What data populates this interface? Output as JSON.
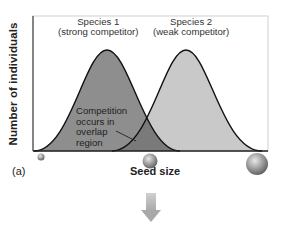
{
  "figure": {
    "panel_label": "(a)",
    "y_axis_label": "Number of individuals",
    "x_axis_label": "Seed size",
    "species": [
      {
        "name": "Species 1",
        "role": "(strong competitor)",
        "fill": "#8e8e8e"
      },
      {
        "name": "Species 2",
        "role": "(weak competitor)",
        "fill": "#c9c9c9"
      }
    ],
    "overlap_annotation": [
      "Competition",
      "occurs in",
      "overlap",
      "region"
    ],
    "overlap_fill": "#7a7a7a",
    "seeds": [
      {
        "size": "small",
        "x": 41
      },
      {
        "size": "medium",
        "x": 150
      },
      {
        "size": "large",
        "x": 257
      }
    ],
    "arrow_color": "#b8b8b8"
  }
}
